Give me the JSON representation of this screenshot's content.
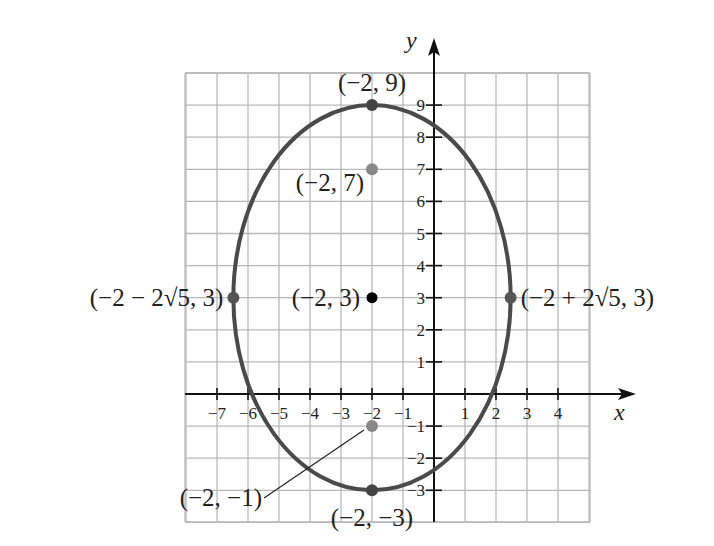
{
  "chart_data": {
    "type": "scatter",
    "title": "",
    "xlabel": "x",
    "ylabel": "y",
    "xlim": [
      -8,
      5
    ],
    "ylim": [
      -4,
      10
    ],
    "grid": true,
    "x_ticks": [
      "-7",
      "-6",
      "-5",
      "-4",
      "-3",
      "-2",
      "-1",
      "1",
      "2",
      "3",
      "4"
    ],
    "x_tick_values": [
      -7,
      -6,
      -5,
      -4,
      -3,
      -2,
      -1,
      1,
      2,
      3,
      4
    ],
    "y_ticks": [
      "9",
      "8",
      "7",
      "6",
      "5",
      "4",
      "3",
      "2",
      "1",
      "-1",
      "-2",
      "-3"
    ],
    "y_tick_values": [
      9,
      8,
      7,
      6,
      5,
      4,
      3,
      2,
      1,
      -1,
      -2,
      -3
    ],
    "curve": {
      "name": "ellipse",
      "center": [
        -2,
        3
      ],
      "semi_major_vertical": 6,
      "semi_minor_horizontal": 4.472
    },
    "points": [
      {
        "label": "(−2, 9)",
        "x": -2,
        "y": 9,
        "role": "vertex"
      },
      {
        "label": "(−2, 7)",
        "x": -2,
        "y": 7,
        "role": "focus"
      },
      {
        "label": "(−2, 3)",
        "x": -2,
        "y": 3,
        "role": "center"
      },
      {
        "label": "(−2, −1)",
        "x": -2,
        "y": -1,
        "role": "focus"
      },
      {
        "label": "(−2, −3)",
        "x": -2,
        "y": -3,
        "role": "vertex"
      },
      {
        "label": "(−2 − 2√5, 3)",
        "x": -6.472,
        "y": 3,
        "role": "co-vertex"
      },
      {
        "label": "(−2 + 2√5, 3)",
        "x": 2.472,
        "y": 3,
        "role": "co-vertex"
      }
    ]
  }
}
